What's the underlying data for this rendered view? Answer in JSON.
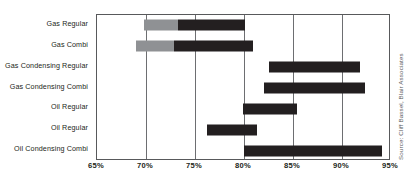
{
  "chart_data": {
    "type": "bar",
    "orientation": "horizontal",
    "subtype": "range-bar",
    "title": "",
    "xlabel": "",
    "ylabel": "",
    "xlim": [
      65,
      95
    ],
    "xticks": [
      65,
      70,
      75,
      80,
      85,
      90,
      95
    ],
    "xtick_labels": [
      "65%",
      "70%",
      "75%",
      "80%",
      "85%",
      "90%",
      "95%"
    ],
    "grid": true,
    "legend": "none",
    "categories": [
      "Gas Regular",
      "Gas Combi",
      "Gas Condensing Regular",
      "Gas Condensing Combi",
      "Oil Regular",
      "Oil Regular",
      "Oil Condensing Combi"
    ],
    "colors": {
      "light_segment": "#8f9194",
      "dark_segment": "#231f20",
      "gridline": "#6d6e71",
      "frame": "#58595b",
      "background": "#ffffff"
    },
    "bars": [
      {
        "category": "Gas Regular",
        "start": 69.8,
        "end": 80.1,
        "segments": [
          {
            "from": 69.8,
            "to": 73.3,
            "shade": "light"
          },
          {
            "from": 73.3,
            "to": 80.1,
            "shade": "dark"
          }
        ]
      },
      {
        "category": "Gas Combi",
        "start": 69.0,
        "end": 80.9,
        "segments": [
          {
            "from": 69.0,
            "to": 72.9,
            "shade": "light"
          },
          {
            "from": 72.9,
            "to": 80.9,
            "shade": "dark"
          }
        ]
      },
      {
        "category": "Gas Condensing Regular",
        "start": 82.5,
        "end": 91.8,
        "segments": [
          {
            "from": 82.5,
            "to": 91.8,
            "shade": "dark"
          }
        ]
      },
      {
        "category": "Gas Condensing Combi",
        "start": 82.0,
        "end": 92.3,
        "segments": [
          {
            "from": 82.0,
            "to": 92.3,
            "shade": "dark"
          }
        ]
      },
      {
        "category": "Oil Regular",
        "start": 79.9,
        "end": 85.4,
        "segments": [
          {
            "from": 79.9,
            "to": 85.4,
            "shade": "dark"
          }
        ]
      },
      {
        "category": "Oil Regular",
        "start": 76.2,
        "end": 81.3,
        "segments": [
          {
            "from": 76.2,
            "to": 81.3,
            "shade": "dark"
          }
        ]
      },
      {
        "category": "Oil Condensing Combi",
        "start": 80.0,
        "end": 94.1,
        "segments": [
          {
            "from": 80.0,
            "to": 94.1,
            "shade": "dark"
          }
        ]
      }
    ]
  },
  "source_note": "Source: Cliff Bassel, Blair Associates"
}
